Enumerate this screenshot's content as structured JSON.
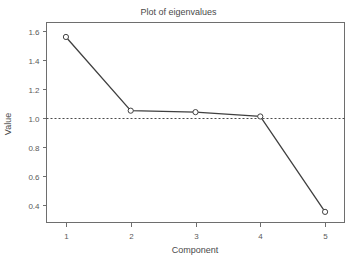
{
  "chart_data": {
    "type": "line",
    "title": "Plot of eigenvalues",
    "xlabel": "Component",
    "ylabel": "Value",
    "x": [
      1,
      2,
      3,
      4,
      5
    ],
    "values": [
      1.56,
      1.05,
      1.04,
      1.01,
      0.35
    ],
    "categories": [
      "1",
      "2",
      "3",
      "4",
      "5"
    ],
    "series": [
      {
        "name": "eigenvalue",
        "values": [
          1.56,
          1.05,
          1.04,
          1.01,
          0.35
        ]
      }
    ],
    "xlim": [
      0.7,
      5.3
    ],
    "ylim": [
      0.28,
      1.66
    ],
    "xticks": [
      1,
      2,
      3,
      4,
      5
    ],
    "xtick_labels": [
      "1",
      "2",
      "3",
      "4",
      "5"
    ],
    "yticks": [
      0.4,
      0.6,
      0.8,
      1.0,
      1.2,
      1.4,
      1.6
    ],
    "ytick_labels": [
      "0.4",
      "0.6",
      "0.8",
      "1.0",
      "1.2",
      "1.4",
      "1.6"
    ],
    "grid": false,
    "legend": "none",
    "marker": "open-circle",
    "line_color": "#404040",
    "marker_fill": "#ffffff",
    "background": "#ffffff",
    "reference_lines": [
      {
        "name": "kaiser-criterion",
        "orientation": "horizontal",
        "value": 1.0,
        "style": "dashed",
        "color": "#4a4a4a"
      }
    ]
  }
}
